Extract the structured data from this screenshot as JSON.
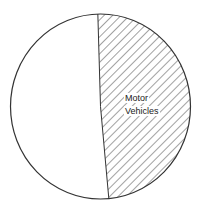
{
  "chart_data": {
    "type": "pie",
    "title": "",
    "slices": [
      {
        "label": "Motor Vehicles",
        "value": 49,
        "fill": "hatched",
        "labeled": true
      },
      {
        "label": "",
        "value": 51,
        "fill": "#ffffff",
        "labeled": false
      }
    ],
    "start_angle_deg": -1.7,
    "direction": "clockwise",
    "legend": "none",
    "grid": false
  },
  "labels": {
    "motor_line1": "Motor",
    "motor_line2": "Vehicles"
  },
  "colors": {
    "stroke": "#333333",
    "hatch": "#444444",
    "background": "#ffffff"
  }
}
